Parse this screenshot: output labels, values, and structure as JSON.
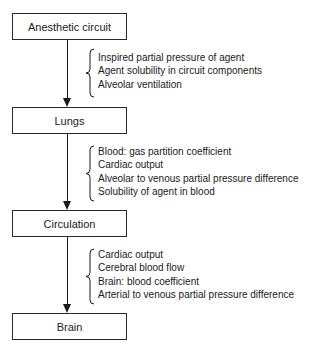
{
  "diagram": {
    "type": "flowchart",
    "direction": "top-to-bottom",
    "nodes": [
      {
        "id": "circuit",
        "label": "Anesthetic circuit"
      },
      {
        "id": "lungs",
        "label": "Lungs"
      },
      {
        "id": "circulation",
        "label": "Circulation"
      },
      {
        "id": "brain",
        "label": "Brain"
      }
    ],
    "transitions": [
      {
        "from": "circuit",
        "to": "lungs",
        "factors": [
          "Inspired partial pressure of agent",
          "Agent solubility in circuit components",
          "Alveolar ventilation"
        ]
      },
      {
        "from": "lungs",
        "to": "circulation",
        "factors": [
          "Blood: gas partition coefficient",
          "Cardiac output",
          "Alveolar to venous partial pressure difference",
          "Solubility of agent in blood"
        ]
      },
      {
        "from": "circulation",
        "to": "brain",
        "factors": [
          "Cardiac output",
          "Cerebral blood flow",
          "Brain: blood coefficient",
          "Arterial to venous partial pressure difference"
        ]
      }
    ]
  }
}
